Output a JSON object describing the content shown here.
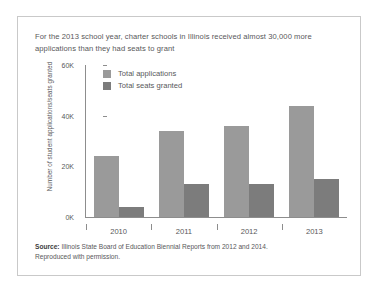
{
  "figure": {
    "caption": "For the 2013 school year, charter schools in Illinois received almost 30,000 more applications than they had seats to grant",
    "source_label": "Source:",
    "source_text": " Illinois State Board of Education Biennial Reports from 2012 and 2014.",
    "source_line2": "Reproduced with permission."
  },
  "colors": {
    "series_applications": "#9a9a9a",
    "series_seats": "#7c7c7c",
    "axis": "#8d8d8d",
    "text": "#58585a",
    "frame": "#c9c9c9"
  },
  "chart_data": {
    "type": "bar",
    "title": "For the 2013 school year, charter schools in Illinois received almost 30,000 more applications than they had seats to grant",
    "xlabel": "",
    "ylabel": "Number of student applications/seats granted",
    "categories": [
      "2010",
      "2011",
      "2012",
      "2013"
    ],
    "series": [
      {
        "name": "Total applications",
        "values": [
          24000,
          34000,
          36000,
          44000
        ]
      },
      {
        "name": "Total seats granted",
        "values": [
          4000,
          13000,
          13000,
          15000
        ]
      }
    ],
    "ylim": [
      0,
      60000
    ],
    "yticks": [
      0,
      20000,
      40000,
      60000
    ],
    "ytick_labels": [
      "0K",
      "20K",
      "40K",
      "60K"
    ],
    "grid": false,
    "legend_position": "upper-left-inside"
  }
}
